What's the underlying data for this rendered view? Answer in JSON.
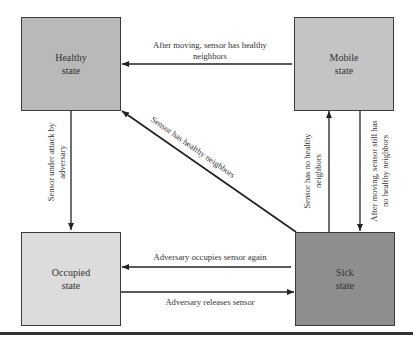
{
  "diagram": {
    "type": "state-transition",
    "colors": {
      "healthy": "#b9b9b9",
      "mobile": "#c4c4c4",
      "occupied": "#dcdcdc",
      "sick": "#8e8e8e",
      "line": "#222222"
    },
    "states": [
      {
        "id": "healthy",
        "label": "Healthy\nstate"
      },
      {
        "id": "mobile",
        "label": "Mobile\nstate"
      },
      {
        "id": "occupied",
        "label": "Occupied\nstate"
      },
      {
        "id": "sick",
        "label": "Sick\nstate"
      }
    ],
    "transitions": [
      {
        "from": "mobile",
        "to": "healthy",
        "label": "After moving, sensor has healthy\nneighbors"
      },
      {
        "from": "healthy",
        "to": "occupied",
        "label": "Sensor under attack by\nadversary"
      },
      {
        "from": "sick",
        "to": "healthy",
        "label": "Sensor has healthy neighbors"
      },
      {
        "from": "sick",
        "to": "mobile",
        "label": "Sensor has no healthy\nneighbors"
      },
      {
        "from": "mobile",
        "to": "sick",
        "label": "After moving, sensor still has\nno healthy neighbors"
      },
      {
        "from": "sick",
        "to": "occupied",
        "label": "Adversary occupies sensor again"
      },
      {
        "from": "occupied",
        "to": "sick",
        "label": "Adversary releases sensor"
      }
    ]
  }
}
